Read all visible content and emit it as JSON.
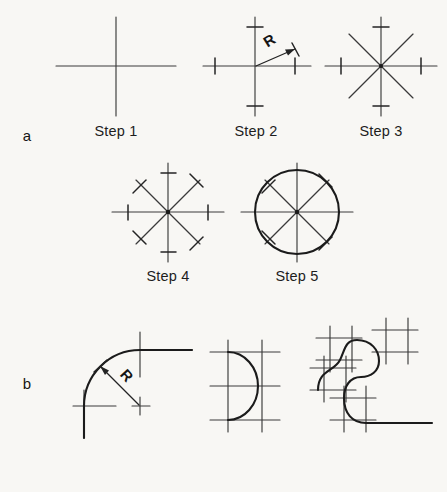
{
  "figure": {
    "background_color": "#f8f7f4",
    "ink_color": "#1b1b1b",
    "panels": [
      {
        "label": "a",
        "label_x": 27,
        "label_y": 141,
        "description": "Five-step construction of a circle from centre lines"
      },
      {
        "label": "b",
        "label_x": 27,
        "label_y": 389,
        "description": "Three-stage construction of tangent arcs and fillets from centre lines"
      }
    ],
    "steps": [
      {
        "caption": "Step 1",
        "caption_x": 116,
        "caption_y": 136
      },
      {
        "caption": "Step 2",
        "caption_x": 256,
        "caption_y": 136
      },
      {
        "caption": "Step 3",
        "caption_x": 381,
        "caption_y": 136
      },
      {
        "caption": "Step 4",
        "caption_x": 168,
        "caption_y": 281
      },
      {
        "caption": "Step 5",
        "caption_x": 297,
        "caption_y": 281
      }
    ],
    "radius_labels": [
      {
        "text": "R",
        "x": 272,
        "y": 45,
        "rotation": -32
      },
      {
        "text": "R",
        "x": 123,
        "y": 379,
        "rotation": 48
      }
    ]
  },
  "geometry": {
    "step1": {
      "center": [
        116,
        66
      ],
      "h_line": [
        56,
        66,
        176,
        66
      ],
      "v_line": [
        116,
        17,
        116,
        116
      ]
    },
    "step2": {
      "center": [
        255,
        66
      ],
      "h_line": [
        203,
        66,
        311,
        66
      ],
      "v_line": [
        255,
        17,
        255,
        116
      ],
      "radius": 40,
      "ticks": [
        [
          295,
          59,
          295,
          74
        ],
        [
          215,
          59,
          215,
          74
        ],
        [
          248,
          27,
          263,
          27
        ],
        [
          248,
          106,
          263,
          106
        ]
      ],
      "leader": [
        255,
        66,
        297,
        48
      ],
      "arrow_at": [
        297,
        48
      ]
    },
    "step3": {
      "center": [
        381,
        66
      ],
      "radius": 40,
      "h_line": [
        325,
        66,
        437,
        66
      ],
      "v_line": [
        381,
        17,
        381,
        116
      ],
      "diagonals": [
        [
          349,
          34,
          413,
          98
        ],
        [
          349,
          98,
          413,
          34
        ]
      ],
      "ticks": [
        [
          341,
          59,
          341,
          74
        ],
        [
          421,
          59,
          421,
          74
        ],
        [
          374,
          27,
          389,
          27
        ],
        [
          374,
          106,
          389,
          106
        ]
      ]
    },
    "step4": {
      "center": [
        168,
        212
      ],
      "radius": 40,
      "h_line": [
        112,
        212,
        224,
        212
      ],
      "v_line": [
        168,
        163,
        168,
        262
      ],
      "diagonals": [
        [
          136,
          180,
          200,
          244
        ],
        [
          136,
          244,
          200,
          180
        ]
      ],
      "axis_ticks": [
        [
          128,
          205,
          128,
          220
        ],
        [
          208,
          205,
          208,
          220
        ],
        [
          161,
          173,
          176,
          173
        ],
        [
          161,
          252,
          176,
          252
        ]
      ],
      "diagonal_ticks": [
        [
          133,
          193,
          146,
          180
        ],
        [
          190,
          250,
          203,
          237
        ],
        [
          133,
          231,
          146,
          244
        ],
        [
          190,
          174,
          203,
          187
        ]
      ]
    },
    "step5": {
      "center": [
        297,
        212
      ],
      "circle_radius": 42,
      "h_line": [
        241,
        212,
        353,
        212
      ],
      "v_line": [
        297,
        163,
        297,
        262
      ],
      "diagonals": [
        [
          265,
          180,
          329,
          244
        ],
        [
          265,
          244,
          329,
          180
        ]
      ],
      "ticks": [
        [
          262,
          193,
          275,
          180
        ],
        [
          319,
          250,
          332,
          237
        ],
        [
          262,
          231,
          275,
          244
        ],
        [
          319,
          174,
          332,
          187
        ]
      ]
    },
    "b1": {
      "corner": [
        140,
        406
      ],
      "radius": 56,
      "arc": "M 84 406 A 56 56 0 0 1 140 350",
      "h_lines": [
        [
          73,
          406,
          113,
          406
        ],
        [
          140,
          350,
          192,
          350
        ]
      ],
      "v_lines": [
        [
          84,
          392,
          84,
          436
        ],
        [
          140,
          333,
          140,
          375
        ]
      ],
      "leader": [
        140,
        406,
        100,
        366
      ],
      "arrow_at": [
        100,
        366
      ],
      "center_tick": [
        [
          132,
          406,
          148,
          406
        ],
        [
          140,
          398,
          140,
          414
        ]
      ]
    },
    "b2": {
      "arc": "M 228 352 A 30 34 0 0 1 228 420",
      "grid_h": [
        [
          210,
          352,
          280,
          352
        ],
        [
          210,
          386,
          280,
          386
        ],
        [
          210,
          420,
          280,
          420
        ]
      ],
      "grid_v": [
        [
          228,
          340,
          228,
          432
        ],
        [
          262,
          340,
          262,
          432
        ]
      ]
    },
    "b3": {
      "path": "M 318 389 C 318 368 336 368 340 358 C 344 348 344 340 356 340 C 372 340 380 352 380 362 C 380 372 372 378 362 378 L 362 378 C 350 378 344 386 344 398 C 344 414 352 424 366 424 L 430 424",
      "grid": [
        [
          316,
          338,
          362,
          338
        ],
        [
          316,
          360,
          362,
          360
        ],
        [
          330,
          326,
          330,
          372
        ],
        [
          352,
          326,
          352,
          372
        ],
        [
          372,
          330,
          418,
          330
        ],
        [
          372,
          352,
          418,
          352
        ],
        [
          386,
          318,
          386,
          364
        ],
        [
          408,
          318,
          408,
          364
        ],
        [
          310,
          368,
          356,
          368
        ],
        [
          310,
          390,
          356,
          390
        ],
        [
          324,
          356,
          324,
          402
        ],
        [
          346,
          356,
          346,
          402
        ],
        [
          330,
          398,
          376,
          398
        ],
        [
          330,
          420,
          376,
          420
        ],
        [
          344,
          386,
          344,
          432
        ],
        [
          366,
          386,
          366,
          432
        ]
      ]
    }
  }
}
